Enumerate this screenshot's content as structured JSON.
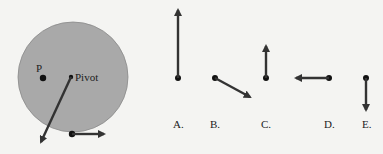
{
  "diagram": {
    "disk": {
      "point_label": "P",
      "pivot_label": "Pivot",
      "fill_color": "#a9a9a9"
    },
    "options": [
      {
        "label": "A.",
        "direction": "up-long"
      },
      {
        "label": "B.",
        "direction": "down-right"
      },
      {
        "label": "C.",
        "direction": "up-short"
      },
      {
        "label": "D.",
        "direction": "left"
      },
      {
        "label": "E.",
        "direction": "down"
      }
    ],
    "colors": {
      "arrow": "#333333",
      "background": "#f4f4f2"
    }
  }
}
